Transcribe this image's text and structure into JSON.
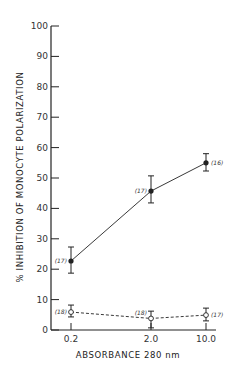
{
  "chart_data": {
    "type": "line",
    "title": "",
    "xlabel": "ABSORBANCE 280 nm",
    "ylabel": "% INHIBITION OF MONOCYTE POLARIZATION",
    "categories": [
      "0.2",
      "2.0",
      "10.0"
    ],
    "ylim": [
      0,
      100
    ],
    "yticks": [
      0,
      10,
      20,
      30,
      40,
      50,
      60,
      70,
      80,
      90,
      100
    ],
    "grid": false,
    "legend": null,
    "series": [
      {
        "name": "filled circles (solid line)",
        "marker": "filled-circle",
        "line_style": "solid",
        "values": [
          22.7,
          45.7,
          55.0
        ],
        "error_low": [
          18.7,
          41.8,
          52.3
        ],
        "error_high": [
          27.3,
          50.7,
          58.0
        ],
        "n_labels": [
          "(17)",
          "(17)",
          "(16)"
        ]
      },
      {
        "name": "open circles (dashed line)",
        "marker": "open-circle",
        "line_style": "dashed",
        "values": [
          5.9,
          3.8,
          4.9
        ],
        "error_low": [
          4.3,
          0.7,
          3.0
        ],
        "error_high": [
          8.2,
          6.2,
          7.2
        ],
        "n_labels": [
          "(18)",
          "(18)",
          "(17)"
        ]
      }
    ]
  },
  "colors": {
    "ink": "#222222",
    "background": "#ffffff"
  }
}
